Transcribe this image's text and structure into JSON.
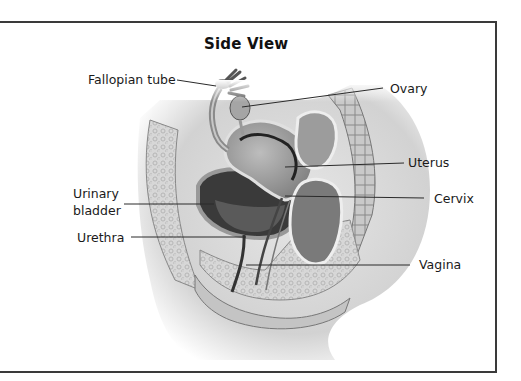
{
  "figure": {
    "title": "Side View",
    "labels": {
      "fallopian_tube": "Fallopian tube",
      "ovary": "Ovary",
      "uterus": "Uterus",
      "urinary_bladder_line1": "Urinary",
      "urinary_bladder_line2": "bladder",
      "cervix": "Cervix",
      "urethra": "Urethra",
      "vagina": "Vagina"
    },
    "colors": {
      "frame": "#3a3a3a",
      "text": "#1a1a1a",
      "leader_line": "#2a2a2a"
    }
  }
}
